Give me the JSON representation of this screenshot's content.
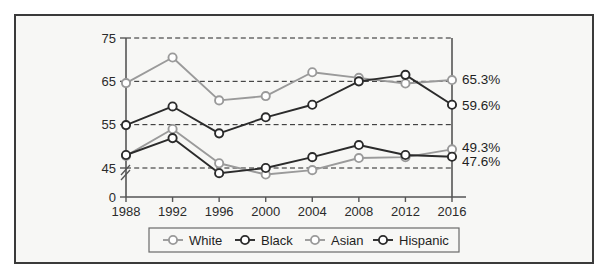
{
  "chart_data": {
    "type": "line",
    "title": "",
    "xlabel": "",
    "ylabel": "",
    "categories": [
      "1988",
      "1992",
      "1996",
      "2000",
      "2004",
      "2008",
      "2012",
      "2016"
    ],
    "x": [
      1988,
      1992,
      1996,
      2000,
      2004,
      2008,
      2012,
      2016
    ],
    "ylim": [
      0,
      75
    ],
    "y_axis_break": true,
    "y_break_between": [
      0,
      45
    ],
    "yticks": [
      "0",
      "45",
      "55",
      "65",
      "75"
    ],
    "ytick_values": [
      0,
      45,
      55,
      65,
      75
    ],
    "gridlines": [
      45,
      55,
      65,
      75
    ],
    "grid": true,
    "grid_style": "dashed-horizontal",
    "legend_position": "bottom",
    "series": [
      {
        "name": "White",
        "color": "#9a9a9a",
        "marker": "open-circle",
        "values": [
          64.6,
          70.5,
          60.6,
          61.6,
          67.1,
          65.8,
          64.5,
          65.3
        ],
        "end_label": "65.3%"
      },
      {
        "name": "Black",
        "color": "#2b2b2b",
        "marker": "open-circle",
        "values": [
          54.9,
          59.2,
          53.0,
          56.7,
          59.6,
          65.0,
          66.5,
          59.6
        ],
        "end_label": "59.6%"
      },
      {
        "name": "Asian",
        "color": "#9a9a9a",
        "marker": "open-circle",
        "values": [
          47.8,
          54.0,
          46.1,
          43.5,
          44.5,
          47.3,
          47.5,
          49.3
        ],
        "end_label": "49.3%"
      },
      {
        "name": "Hispanic",
        "color": "#2b2b2b",
        "marker": "open-circle",
        "values": [
          48.0,
          51.9,
          43.8,
          45.0,
          47.5,
          50.3,
          48.0,
          47.6
        ],
        "end_label": "47.6%"
      }
    ],
    "end_labels": [
      "65.3%",
      "59.6%",
      "49.3%",
      "47.6%"
    ]
  },
  "legend": {
    "items": [
      {
        "label": "White",
        "color": "#9a9a9a"
      },
      {
        "label": "Black",
        "color": "#2b2b2b"
      },
      {
        "label": "Asian",
        "color": "#9a9a9a"
      },
      {
        "label": "Hispanic",
        "color": "#2b2b2b"
      }
    ]
  },
  "colors": {
    "light_series": "#9a9a9a",
    "dark_series": "#2b2b2b",
    "background": "#f7f7f5",
    "border": "#3a3a3a",
    "axis": "#555555"
  }
}
